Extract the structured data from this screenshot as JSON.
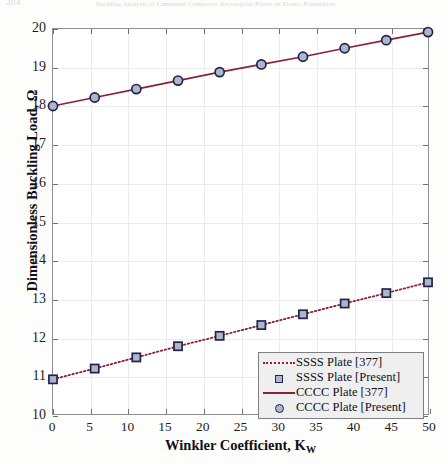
{
  "header": {
    "folio": "204",
    "running_title": "Buckling Analysis of Laminated Composite Rectangular Plates on Elastic Foundation"
  },
  "chart_data": {
    "type": "line",
    "title": "",
    "xlabel": "Winkler Coefficient, K",
    "xlabel_sub": "W",
    "ylabel": "Dimensionless Buckling Load, Ω",
    "xlim": [
      0,
      50
    ],
    "ylim": [
      10,
      20
    ],
    "xticks": [
      0,
      5,
      10,
      15,
      20,
      25,
      30,
      35,
      40,
      45,
      50
    ],
    "yticks": [
      10,
      11,
      12,
      13,
      14,
      15,
      16,
      17,
      18,
      19,
      20
    ],
    "xtick_labels": [
      "0",
      "5",
      "10",
      "15",
      "20",
      "25",
      "30",
      "35",
      "40",
      "45",
      "50"
    ],
    "ytick_labels": [
      "10",
      "11",
      "12",
      "13",
      "14",
      "15",
      "16",
      "17",
      "18",
      "19",
      "20"
    ],
    "grid": true,
    "legend_position": "lower right",
    "x": [
      0,
      5.56,
      11.11,
      16.67,
      22.22,
      27.78,
      33.33,
      38.89,
      44.44,
      50
    ],
    "series": [
      {
        "name": "SSSS Plate [377]",
        "style": "dotted-line",
        "color": "#8c1f3d",
        "values": [
          10.9,
          11.18,
          11.47,
          11.76,
          12.03,
          12.31,
          12.59,
          12.87,
          13.14,
          13.42
        ]
      },
      {
        "name": "SSSS Plate [Present]",
        "style": "square-marker",
        "color": "#232347",
        "fill": "#aab7cc",
        "values": [
          10.9,
          11.18,
          11.47,
          11.76,
          12.03,
          12.31,
          12.59,
          12.87,
          13.14,
          13.42
        ]
      },
      {
        "name": "CCCC Plate [377]",
        "style": "solid-line",
        "color": "#8c1f3d",
        "values": [
          18.0,
          18.22,
          18.44,
          18.66,
          18.88,
          19.08,
          19.28,
          19.5,
          19.71,
          19.92
        ]
      },
      {
        "name": "CCCC Plate [Present]",
        "style": "circle-marker",
        "color": "#232347",
        "fill": "#aab7cc",
        "values": [
          18.0,
          18.22,
          18.44,
          18.66,
          18.88,
          19.08,
          19.28,
          19.5,
          19.71,
          19.92
        ]
      }
    ],
    "legend": [
      {
        "label": "SSSS Plate [377]",
        "key": "dotted"
      },
      {
        "label": "SSSS Plate [Present]",
        "key": "square"
      },
      {
        "label": "CCCC Plate [377]",
        "key": "solid"
      },
      {
        "label": "CCCC Plate [Present]",
        "key": "circle"
      }
    ]
  }
}
